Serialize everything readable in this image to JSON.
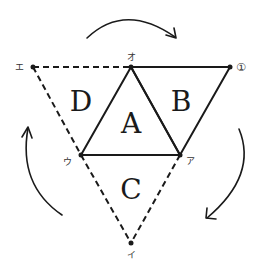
{
  "diagram": {
    "regions": {
      "A": "A",
      "B": "B",
      "C": "C",
      "D": "D"
    },
    "vertices": {
      "o": "オ",
      "circled_1": "①",
      "e": "エ",
      "u": "ウ",
      "a": "ア",
      "i": "イ"
    },
    "arrows": {
      "direction": "clockwise",
      "count": 3
    },
    "colors": {
      "line": "#1a1a1a",
      "background": "#ffffff"
    }
  }
}
